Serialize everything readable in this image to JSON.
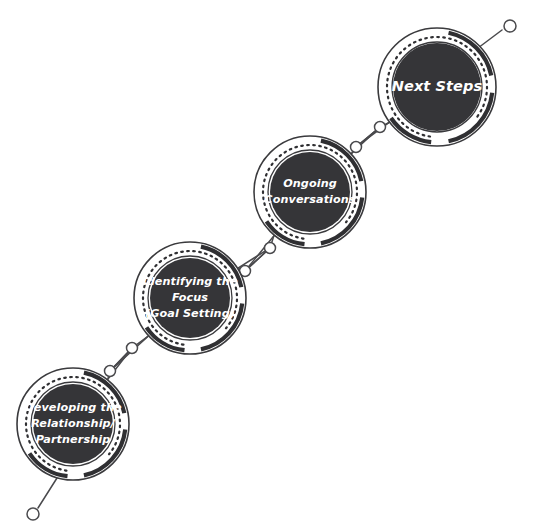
{
  "diagram": {
    "type": "circular-process-chain",
    "title": "",
    "orientation": "diagonal-ascending",
    "colors": {
      "node_fill": "#353538",
      "node_label": "#ffffff",
      "ring_stroke": "#2f2f32",
      "outline": "#3a3a3d",
      "background": "#ffffff",
      "connector_stroke": "#4a4a4d",
      "connector_node_fill": "#ffffff"
    },
    "nodes": [
      {
        "id": "node-developing-relationship",
        "order": 1,
        "name": "developing-the-relationship-partnership",
        "lines": [
          "Developing the",
          "Relationship/",
          "Partnership"
        ],
        "cx": 73,
        "cy": 424,
        "r_outer": 56,
        "r_disc": 40,
        "font_size": 11.2
      },
      {
        "id": "node-identifying-focus",
        "order": 2,
        "name": "identifying-the-focus-goal-setting",
        "lines": [
          "Identifying the",
          "Focus",
          "(Goal Setting)"
        ],
        "cx": 190,
        "cy": 298,
        "r_outer": 56,
        "r_disc": 40,
        "font_size": 11.2
      },
      {
        "id": "node-ongoing-conversations",
        "order": 3,
        "name": "ongoing-conversations",
        "lines": [
          "Ongoing",
          "Conversations"
        ],
        "cx": 310,
        "cy": 192,
        "r_outer": 56,
        "r_disc": 40,
        "font_size": 11.2
      },
      {
        "id": "node-next-steps",
        "order": 4,
        "name": "next-steps",
        "lines": [
          "Next Steps"
        ],
        "cx": 437,
        "cy": 87,
        "r_outer": 59,
        "r_disc": 44,
        "font_size": 14.5
      }
    ],
    "connectors": [
      {
        "id": "connector-1-2",
        "name": "connector-developing-to-identifying",
        "from": "node-developing-relationship",
        "to": "node-identifying-focus",
        "knob_a": {
          "cx": 110,
          "cy": 371
        },
        "knob_b": {
          "cx": 132,
          "cy": 348
        }
      },
      {
        "id": "connector-2-3",
        "name": "connector-identifying-to-ongoing",
        "from": "node-identifying-focus",
        "to": "node-ongoing-conversations",
        "knob_a": {
          "cx": 245,
          "cy": 271
        },
        "knob_b": {
          "cx": 270,
          "cy": 248
        }
      },
      {
        "id": "connector-3-4",
        "name": "connector-ongoing-to-next-steps",
        "from": "node-ongoing-conversations",
        "to": "node-next-steps",
        "knob_a": {
          "cx": 356,
          "cy": 147
        },
        "knob_b": {
          "cx": 380,
          "cy": 127
        }
      }
    ],
    "tails": [
      {
        "id": "tail-start",
        "name": "tail-start-marker",
        "attached_to": "node-developing-relationship",
        "line": {
          "x1": 57,
          "y1": 478,
          "x2": 38,
          "y2": 508
        },
        "endpoint": {
          "cx": 33,
          "cy": 514,
          "r": 6
        }
      },
      {
        "id": "tail-end",
        "name": "tail-end-marker",
        "attached_to": "node-next-steps",
        "line": {
          "x1": 478,
          "y1": 48,
          "x2": 502,
          "y2": 30
        },
        "endpoint": {
          "cx": 510,
          "cy": 26,
          "r": 6
        }
      }
    ]
  }
}
